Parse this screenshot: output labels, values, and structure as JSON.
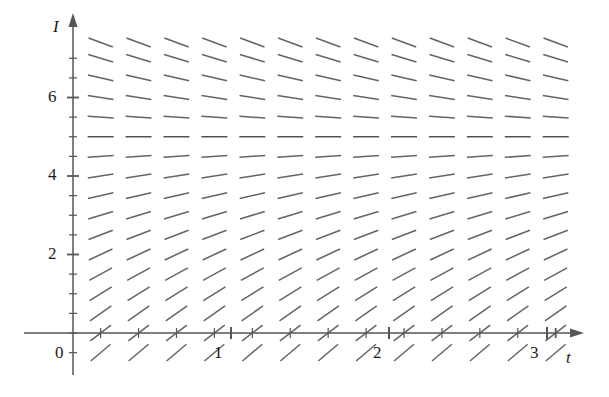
{
  "figure": {
    "width": 609,
    "height": 397,
    "background": "#ffffff",
    "ink_color": "#4a4a4a",
    "axis_color": "#55555a",
    "text_color": "#1a1a1a"
  },
  "axes": {
    "x_axis": {
      "label": "t",
      "label_x": 566,
      "label_y": 357,
      "pixel_y": 333,
      "start_px": 24,
      "end_px": 575,
      "arrow": "right-arrow",
      "tick_labels": [
        {
          "text": "0",
          "value": 0,
          "px": 60,
          "py": 352
        },
        {
          "text": "1",
          "value": 1,
          "px": 218,
          "py": 352
        },
        {
          "text": "2",
          "value": 2,
          "px": 377,
          "py": 352
        },
        {
          "text": "3",
          "value": 3,
          "px": 534,
          "py": 352
        }
      ]
    },
    "y_axis": {
      "label": "I",
      "label_x": 53,
      "label_y": 17,
      "pixel_x": 73,
      "start_px": 375,
      "end_px": 22,
      "arrow": "up-arrow",
      "tick_labels": [
        {
          "text": "2",
          "value": 2,
          "px": 52,
          "py": 245
        },
        {
          "text": "4",
          "value": 4,
          "px": 52,
          "py": 166
        },
        {
          "text": "6",
          "value": 6,
          "px": 52,
          "py": 88
        }
      ]
    }
  },
  "chart_data": {
    "type": "scatter",
    "title": "",
    "xlabel": "t",
    "ylabel": "I",
    "xlim": [
      -0.05,
      3.25
    ],
    "ylim": [
      -0.55,
      7.6
    ],
    "grid": false,
    "legend": null,
    "equilibrium_value": 5,
    "slope_formula": "dI/dt = 0.62 * (5 - I)",
    "x_values": [
      0.175,
      0.415,
      0.655,
      0.895,
      1.135,
      1.375,
      1.615,
      1.855,
      2.095,
      2.335,
      2.575,
      2.815,
      3.055
    ],
    "y_values": [
      -0.5,
      0.0,
      0.5,
      1.0,
      1.5,
      2.0,
      2.5,
      3.0,
      3.5,
      4.0,
      4.5,
      5.0,
      5.5,
      6.0,
      6.5,
      7.0,
      7.4
    ],
    "segment_px_length": 26,
    "segments_note": "At each (x,y) lattice point a short line segment is drawn whose slope equals 0.62*(5 - y)."
  }
}
